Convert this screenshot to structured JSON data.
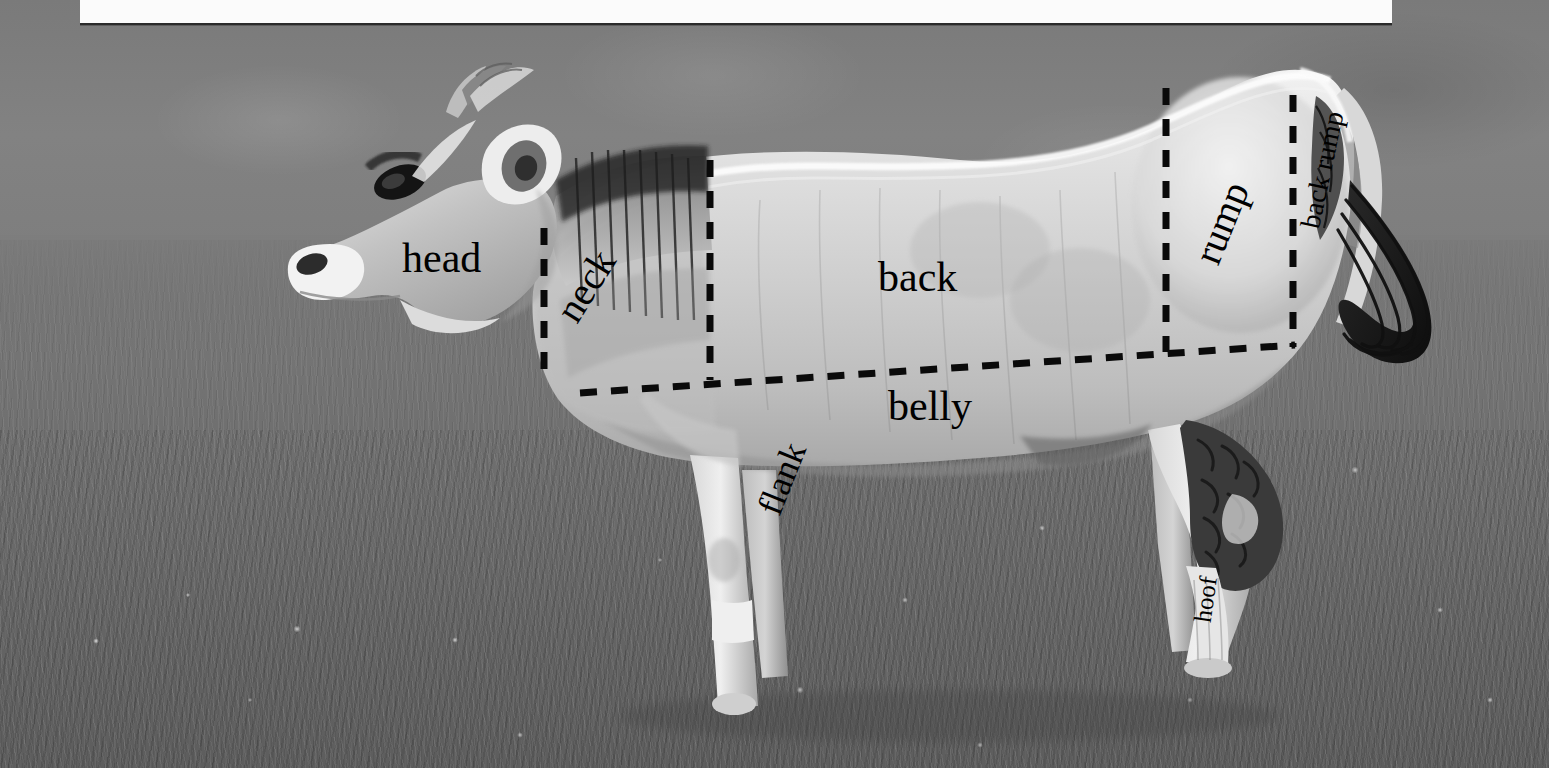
{
  "figure": {
    "kind": "labeled-photograph",
    "banner_text": ""
  },
  "labels": {
    "head": "head",
    "neck": "neck",
    "back": "back",
    "rump": "rump",
    "back_rump": "back rump",
    "belly": "belly",
    "flank": "flank",
    "hoof": "hoof"
  },
  "colors": {
    "line": "#0a0a0a",
    "label_text": "#000000",
    "banner": "#fbfbfb",
    "sky": "#7d7d7d",
    "field": "#6b6b6b",
    "cow_light": "#e9e9e9",
    "cow_mid": "#b9b9b9",
    "cow_dark": "#3a3a3a"
  },
  "annotations": {
    "divider_head_neck": {
      "x": 544,
      "y1": 228,
      "y2": 372,
      "orientation": "vertical"
    },
    "divider_neck_back": {
      "x": 710,
      "y1": 160,
      "y2": 378,
      "orientation": "vertical"
    },
    "divider_back_rump": {
      "x": 1166,
      "y1": 88,
      "y2": 352,
      "orientation": "vertical"
    },
    "divider_rump_backrump": {
      "x": 1293,
      "y1": 95,
      "y2": 347,
      "orientation": "vertical"
    },
    "belly_line": {
      "x1": 580,
      "y1": 393,
      "x2": 1295,
      "y2": 345,
      "orientation": "sloped-horizontal"
    }
  },
  "label_positions": {
    "head": {
      "x": 402,
      "y": 258,
      "rotation": 0,
      "size": 42
    },
    "neck": {
      "x": 566,
      "y": 318,
      "rotation": -58,
      "size": 40
    },
    "back": {
      "x": 878,
      "y": 277,
      "rotation": 0,
      "size": 42
    },
    "rump": {
      "x": 1206,
      "y": 262,
      "rotation": -68,
      "size": 40
    },
    "back_rump": {
      "x": 1310,
      "y": 228,
      "rotation": -78,
      "size": 28
    },
    "belly": {
      "x": 888,
      "y": 406,
      "rotation": 0,
      "size": 42
    },
    "flank": {
      "x": 768,
      "y": 513,
      "rotation": -68,
      "size": 36
    },
    "hoof": {
      "x": 1202,
      "y": 622,
      "rotation": -82,
      "size": 25
    }
  }
}
